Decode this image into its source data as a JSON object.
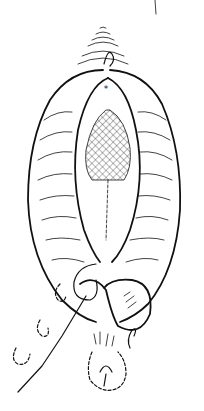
{
  "illustration": {
    "type": "line-art medical illustration",
    "background": "#ffffff",
    "ink_color": "#111111",
    "regions": [
      "upper-folds",
      "marked-point",
      "outer-contour",
      "inner-contour",
      "mesh-area",
      "looped-suture",
      "balloon-shape",
      "lower-structure"
    ],
    "marker_symbol": "*"
  }
}
